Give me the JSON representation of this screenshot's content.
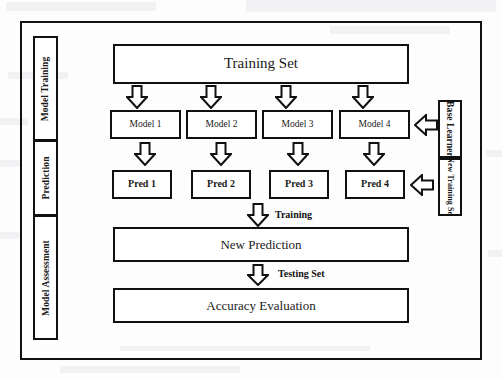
{
  "diagram": {
    "stroke_color": "#111111",
    "background_color": "#fdfdfd"
  },
  "stages": {
    "label_model_training": "Model Training",
    "label_prediction": "Prediction",
    "label_model_assessment": "Model Assessment"
  },
  "inputs": {
    "label_base_learner": "Base Learner",
    "label_new_training_set": "New Training Set"
  },
  "nodes": {
    "training_set": "Training Set",
    "new_prediction": "New Prediction",
    "accuracy_evaluation": "Accuracy Evaluation"
  },
  "models": [
    {
      "label": "Model 1"
    },
    {
      "label": "Model 2"
    },
    {
      "label": "Model 3"
    },
    {
      "label": "Model 4"
    }
  ],
  "predictions": [
    {
      "label": "Pred 1"
    },
    {
      "label": "Pred 2"
    },
    {
      "label": "Pred 3"
    },
    {
      "label": "Pred 4"
    }
  ],
  "edge_labels": {
    "training": "Training",
    "testing_set": "Testing Set"
  },
  "icons": {
    "down_arrow": "down-block-arrow",
    "left_arrow": "left-block-arrow"
  }
}
